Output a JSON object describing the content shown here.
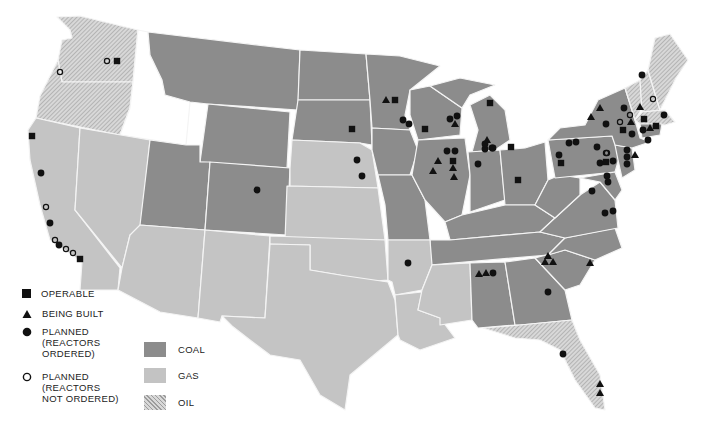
{
  "legend": {
    "facilities": [
      {
        "symbol": "square",
        "label": "OPERABLE"
      },
      {
        "symbol": "triangle",
        "label": "BEING BUILT"
      },
      {
        "symbol": "filled-circle",
        "label_lines": [
          "PLANNED",
          "(REACTORS",
          "ORDERED)"
        ]
      },
      {
        "symbol": "open-circle",
        "label_lines": [
          "PLANNED",
          "(REACTORS",
          "NOT ORDERED)"
        ]
      }
    ],
    "fuels": [
      {
        "key": "coal",
        "label": "COAL",
        "color": "#8c8c8c"
      },
      {
        "key": "gas",
        "label": "GAS",
        "color": "#c3c3c3"
      },
      {
        "key": "oil",
        "label": "OIL",
        "color": "#cfcfcf",
        "pattern": "diagonal-hatch"
      }
    ]
  },
  "colors": {
    "coal": "#8c8c8c",
    "gas": "#c4c4c4",
    "oil_base": "#d6d6d6",
    "oil_hatch": "#9a9a9a",
    "none": "#ffffff",
    "border": "#f2f2f2",
    "marker": "#111111"
  },
  "markers": [
    {
      "type": "square",
      "x": 117,
      "y": 61
    },
    {
      "type": "open",
      "x": 107,
      "y": 61
    },
    {
      "type": "open",
      "x": 60,
      "y": 72
    },
    {
      "type": "square",
      "x": 32,
      "y": 136
    },
    {
      "type": "circle",
      "x": 41,
      "y": 173
    },
    {
      "type": "open",
      "x": 46,
      "y": 207
    },
    {
      "type": "circle",
      "x": 50,
      "y": 223
    },
    {
      "type": "open",
      "x": 55,
      "y": 240
    },
    {
      "type": "circle",
      "x": 59,
      "y": 245
    },
    {
      "type": "open",
      "x": 66,
      "y": 249
    },
    {
      "type": "open",
      "x": 73,
      "y": 253
    },
    {
      "type": "square",
      "x": 80,
      "y": 259
    },
    {
      "type": "circle",
      "x": 257,
      "y": 190
    },
    {
      "type": "triangle",
      "x": 386,
      "y": 100
    },
    {
      "type": "square",
      "x": 395,
      "y": 100
    },
    {
      "type": "square",
      "x": 352,
      "y": 129
    },
    {
      "type": "circle",
      "x": 403,
      "y": 120
    },
    {
      "type": "circle",
      "x": 409,
      "y": 124
    },
    {
      "type": "square",
      "x": 425,
      "y": 129
    },
    {
      "type": "circle",
      "x": 450,
      "y": 119
    },
    {
      "type": "circle",
      "x": 457,
      "y": 116
    },
    {
      "type": "triangle",
      "x": 455,
      "y": 124
    },
    {
      "type": "square",
      "x": 490,
      "y": 103
    },
    {
      "type": "circle",
      "x": 357,
      "y": 160
    },
    {
      "type": "circle",
      "x": 362,
      "y": 176
    },
    {
      "type": "circle",
      "x": 447,
      "y": 151
    },
    {
      "type": "circle",
      "x": 455,
      "y": 151
    },
    {
      "type": "triangle",
      "x": 438,
      "y": 161
    },
    {
      "type": "square",
      "x": 453,
      "y": 161
    },
    {
      "type": "triangle",
      "x": 433,
      "y": 171
    },
    {
      "type": "triangle",
      "x": 453,
      "y": 168
    },
    {
      "type": "triangle",
      "x": 454,
      "y": 177
    },
    {
      "type": "triangle",
      "x": 487,
      "y": 140
    },
    {
      "type": "circle",
      "x": 485,
      "y": 149
    },
    {
      "type": "circle",
      "x": 492,
      "y": 148
    },
    {
      "type": "square",
      "x": 511,
      "y": 147
    },
    {
      "type": "circle",
      "x": 478,
      "y": 164
    },
    {
      "type": "square",
      "x": 518,
      "y": 180
    },
    {
      "type": "circle",
      "x": 485,
      "y": 144
    },
    {
      "type": "circle",
      "x": 493,
      "y": 148
    },
    {
      "type": "circle",
      "x": 569,
      "y": 143
    },
    {
      "type": "circle",
      "x": 576,
      "y": 142
    },
    {
      "type": "circle",
      "x": 597,
      "y": 147
    },
    {
      "type": "open",
      "x": 606,
      "y": 153
    },
    {
      "type": "circle",
      "x": 559,
      "y": 155
    },
    {
      "type": "square",
      "x": 561,
      "y": 163
    },
    {
      "type": "circle",
      "x": 600,
      "y": 163
    },
    {
      "type": "square",
      "x": 606,
      "y": 162
    },
    {
      "type": "circle",
      "x": 613,
      "y": 161
    },
    {
      "type": "circle",
      "x": 607,
      "y": 176
    },
    {
      "type": "circle",
      "x": 608,
      "y": 182
    },
    {
      "type": "circle",
      "x": 592,
      "y": 191
    },
    {
      "type": "circle",
      "x": 605,
      "y": 213
    },
    {
      "type": "circle",
      "x": 613,
      "y": 211
    },
    {
      "type": "circle",
      "x": 642,
      "y": 75
    },
    {
      "type": "open",
      "x": 653,
      "y": 99
    },
    {
      "type": "triangle",
      "x": 600,
      "y": 108
    },
    {
      "type": "triangle",
      "x": 591,
      "y": 117
    },
    {
      "type": "circle",
      "x": 624,
      "y": 108
    },
    {
      "type": "open",
      "x": 630,
      "y": 115
    },
    {
      "type": "triangle",
      "x": 640,
      "y": 107
    },
    {
      "type": "square",
      "x": 644,
      "y": 119
    },
    {
      "type": "circle",
      "x": 664,
      "y": 115
    },
    {
      "type": "circle",
      "x": 606,
      "y": 124
    },
    {
      "type": "open",
      "x": 620,
      "y": 122
    },
    {
      "type": "triangle",
      "x": 631,
      "y": 122
    },
    {
      "type": "square",
      "x": 623,
      "y": 130
    },
    {
      "type": "circle",
      "x": 632,
      "y": 134
    },
    {
      "type": "circle",
      "x": 643,
      "y": 130
    },
    {
      "type": "triangle",
      "x": 650,
      "y": 128
    },
    {
      "type": "square",
      "x": 656,
      "y": 126
    },
    {
      "type": "circle",
      "x": 648,
      "y": 140
    },
    {
      "type": "circle",
      "x": 627,
      "y": 150
    },
    {
      "type": "circle",
      "x": 627,
      "y": 157
    },
    {
      "type": "triangle",
      "x": 635,
      "y": 155
    },
    {
      "type": "circle",
      "x": 627,
      "y": 164
    },
    {
      "type": "open",
      "x": 607,
      "y": 153
    },
    {
      "type": "circle",
      "x": 408,
      "y": 263
    },
    {
      "type": "triangle",
      "x": 479,
      "y": 274
    },
    {
      "type": "triangle",
      "x": 486,
      "y": 273
    },
    {
      "type": "circle",
      "x": 493,
      "y": 273
    },
    {
      "type": "triangle",
      "x": 548,
      "y": 256
    },
    {
      "type": "triangle",
      "x": 545,
      "y": 262
    },
    {
      "type": "triangle",
      "x": 553,
      "y": 262
    },
    {
      "type": "triangle",
      "x": 590,
      "y": 263
    },
    {
      "type": "circle",
      "x": 548,
      "y": 292
    },
    {
      "type": "circle",
      "x": 563,
      "y": 354
    },
    {
      "type": "triangle",
      "x": 600,
      "y": 384
    },
    {
      "type": "triangle",
      "x": 600,
      "y": 393
    }
  ]
}
